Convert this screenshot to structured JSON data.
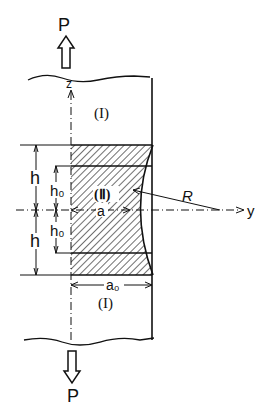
{
  "diagram": {
    "type": "mechanical-specimen-notched-bar",
    "load": {
      "top_label": "P",
      "bottom_label": "P",
      "direction": "tension"
    },
    "axes": {
      "vertical": "z",
      "horizontal": "y"
    },
    "regions": {
      "outer_top": "(I)",
      "outer_bottom": "(I)",
      "middle": "(Ⅱ)"
    },
    "dimensions": {
      "h_upper": "h",
      "h_lower": "h",
      "h0_upper": "h₀",
      "h0_lower": "h₀",
      "min_width": "a",
      "full_width": "a₀",
      "radius": "R"
    },
    "colors": {
      "ink": "#111111",
      "background": "#ffffff"
    }
  }
}
